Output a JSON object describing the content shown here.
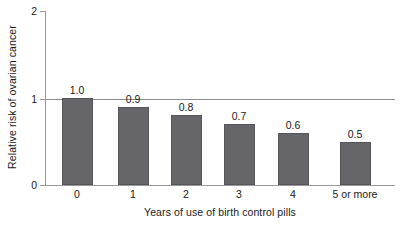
{
  "chart_data": {
    "type": "bar",
    "title": "",
    "subtitle": "",
    "categories": [
      "0",
      "1",
      "2",
      "3",
      "4",
      "5 or more"
    ],
    "values": [
      1.0,
      0.9,
      0.8,
      0.7,
      0.6,
      0.5
    ],
    "value_labels": [
      "1.0",
      "0.9",
      "0.8",
      "0.7",
      "0.6",
      "0.5"
    ],
    "xlabel": "Years of use of birth control pills",
    "ylabel": "Relative risk of ovarian cancer",
    "ylim": [
      0,
      2
    ],
    "yticks": [
      0,
      1,
      2
    ],
    "ytick_labels": [
      "0",
      "1",
      "2"
    ],
    "grid": false,
    "legend": null,
    "reference_line": {
      "value": 1,
      "label": ""
    },
    "bar_color": "#66666a",
    "bar_edge_color": "#55555a",
    "axis_color": "#9a9a9a",
    "text_color": "#1a1a1a",
    "background_color": "#ffffff"
  },
  "axis": {
    "y_tick_0": "0",
    "y_tick_1": "1",
    "y_tick_2": "2"
  }
}
